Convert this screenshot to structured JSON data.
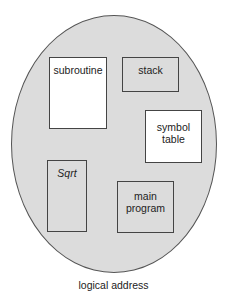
{
  "diagram": {
    "title": "logical address",
    "container": {
      "shape": "ellipse",
      "fill": "#dcdcdc",
      "stroke": "#555555"
    },
    "segments": [
      {
        "id": "subroutine",
        "label": "subroutine",
        "fill": "#ffffff",
        "italic": false
      },
      {
        "id": "stack",
        "label": "stack",
        "fill": "#dcdcdc",
        "italic": false
      },
      {
        "id": "symbol-table",
        "label_lines": [
          "symbol",
          "table"
        ],
        "fill": "#ffffff",
        "italic": false
      },
      {
        "id": "sqrt",
        "label": "Sqrt",
        "fill": "#dcdcdc",
        "italic": true
      },
      {
        "id": "main-program",
        "label_lines": [
          "main",
          "program"
        ],
        "fill": "#dcdcdc",
        "italic": false
      }
    ]
  }
}
